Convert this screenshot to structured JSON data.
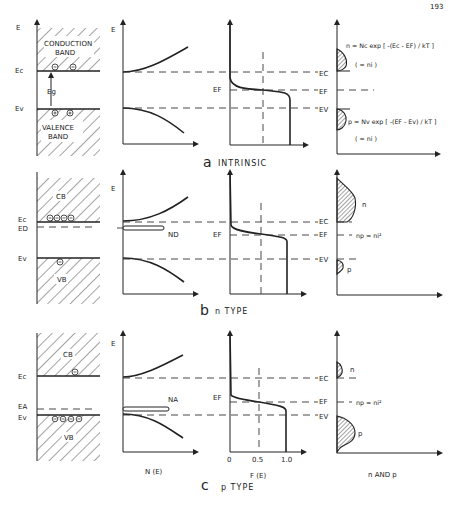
{
  "page_number": "193",
  "panels": [
    {
      "id": "a",
      "caption_letter": "a",
      "caption_text": "INTRINSIC",
      "band_diagram": {
        "axis_label": "E",
        "conduction_band_label_1": "CONDUCTION",
        "conduction_band_label_2": "BAND",
        "valence_band_label_1": "VALENCE",
        "valence_band_label_2": "BAND",
        "ec_label": "Ec",
        "ev_label": "Ev",
        "gap_label": "Eg",
        "electrons": 2,
        "holes": 2
      },
      "dos": {
        "axis_label": "E"
      },
      "fermi": {
        "ef_label": "EF"
      },
      "carriers": {
        "ec_label": "EC",
        "ef_label": "EF",
        "ev_label": "EV",
        "n_equation": "n = Nc exp [ -(Ec - EF) / kT ]",
        "n_note": "( = ni )",
        "p_equation": "p = Nv exp [ -(EF - Ev) / kT ]",
        "p_note": "( = ni )"
      }
    },
    {
      "id": "b",
      "caption_letter": "b",
      "caption_text": "n TYPE",
      "band_diagram": {
        "cb_label": "CB",
        "vb_label": "VB",
        "ec_label": "Ec",
        "ed_label": "ED",
        "ev_label": "Ev",
        "electrons": 4,
        "holes": 1
      },
      "dos": {
        "axis_label": "E",
        "impurity_label": "ND"
      },
      "fermi": {
        "ef_label": "EF"
      },
      "carriers": {
        "ec_label": "EC",
        "ef_label": "EF",
        "ev_label": "EV",
        "n_label": "n",
        "p_label": "p",
        "law": "np = ni²"
      }
    },
    {
      "id": "c",
      "caption_letter": "c",
      "caption_text": "p TYPE",
      "band_diagram": {
        "cb_label": "CB",
        "vb_label": "VB",
        "ec_label": "Ec",
        "ea_label": "EA",
        "ev_label": "Ev",
        "electrons": 1,
        "holes": 4
      },
      "dos": {
        "axis_label": "E",
        "impurity_label": "NA",
        "x_label": "N (E)"
      },
      "fermi": {
        "ef_label": "EF",
        "x_label": "F (E)",
        "ticks": [
          "0",
          "0.5",
          "1.0"
        ]
      },
      "carriers": {
        "ec_label": "EC",
        "ef_label": "EF",
        "ev_label": "EV",
        "n_label": "n",
        "p_label": "p",
        "law": "np = ni²",
        "x_label": "n AND p"
      }
    }
  ]
}
